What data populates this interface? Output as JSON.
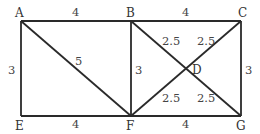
{
  "diagram": {
    "type": "weighted-graph",
    "nodes": [
      {
        "id": "A",
        "label": "A"
      },
      {
        "id": "B",
        "label": "B"
      },
      {
        "id": "C",
        "label": "C"
      },
      {
        "id": "D",
        "label": "D"
      },
      {
        "id": "E",
        "label": "E"
      },
      {
        "id": "F",
        "label": "F"
      },
      {
        "id": "G",
        "label": "G"
      }
    ],
    "edges": [
      {
        "from": "A",
        "to": "B",
        "weight": "4"
      },
      {
        "from": "B",
        "to": "C",
        "weight": "4"
      },
      {
        "from": "A",
        "to": "E",
        "weight": "3"
      },
      {
        "from": "A",
        "to": "F",
        "weight": "5"
      },
      {
        "from": "B",
        "to": "F",
        "weight": "3"
      },
      {
        "from": "C",
        "to": "G",
        "weight": "3"
      },
      {
        "from": "E",
        "to": "F",
        "weight": "4"
      },
      {
        "from": "F",
        "to": "G",
        "weight": "4"
      },
      {
        "from": "B",
        "to": "D",
        "weight": "2.5"
      },
      {
        "from": "C",
        "to": "D",
        "weight": "2.5"
      },
      {
        "from": "F",
        "to": "D",
        "weight": "2.5"
      },
      {
        "from": "G",
        "to": "D",
        "weight": "2.5"
      }
    ]
  }
}
